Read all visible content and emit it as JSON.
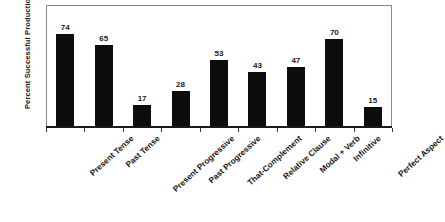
{
  "chart_data": {
    "type": "bar",
    "title": "",
    "subtitle": "",
    "xlabel": "",
    "ylabel": "Percent Successful Production",
    "ylim": [
      0,
      97
    ],
    "grid": false,
    "legend": "none",
    "bar_color": "#0d0d0d",
    "frame_color": "#8a8a8a",
    "axis_color": "#1a1a1a",
    "categories": [
      "Present Tense",
      "Past Tense",
      "Present Progressive",
      "Past Progressive",
      "That-Complement",
      "Relative Clause",
      "Modal + Verb",
      "Infinitive",
      "Perfect Aspect"
    ],
    "values": [
      74,
      65,
      17,
      28,
      53,
      43,
      47,
      70,
      15
    ],
    "value_labels": [
      "74",
      "65",
      "17",
      "28",
      "53",
      "43",
      "47",
      "70",
      "15"
    ],
    "tick_count": 10
  }
}
